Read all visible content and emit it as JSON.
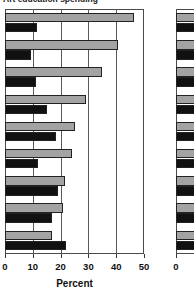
{
  "figure": {
    "title_partial": "Art education spending",
    "title_visible": "cropped"
  },
  "axis": {
    "label": "Percent",
    "ticks": [
      0,
      10,
      20,
      30,
      40,
      50
    ],
    "tick_labels": [
      "0",
      "10",
      "20",
      "30",
      "40",
      "50"
    ],
    "min": 0,
    "max": 50
  },
  "right_panel": {
    "tick_labels": [
      "0"
    ],
    "note": "clipped second panel"
  },
  "colors": {
    "series_gray": "#a3a3a3",
    "series_black": "#111111",
    "frame": "#4a4a4a",
    "gridline": "#5a5a5a",
    "background": "#ffffff"
  },
  "chart_data": {
    "type": "bar",
    "orientation": "horizontal",
    "title": "Art education spending",
    "xlabel": "Percent",
    "ylabel": "",
    "xlim": [
      0,
      50
    ],
    "xticks": [
      0,
      10,
      20,
      30,
      40,
      50
    ],
    "grid": true,
    "legend_position": "none",
    "categories": [
      "1",
      "2",
      "3",
      "4",
      "5",
      "6",
      "7",
      "8",
      "9"
    ],
    "series": [
      {
        "name": "Gray",
        "color": "#a3a3a3",
        "values": [
          46.5,
          40.5,
          35.0,
          29.0,
          25.0,
          24.0,
          21.5,
          21.0,
          17.0
        ]
      },
      {
        "name": "Black",
        "color": "#111111",
        "values": [
          11.5,
          9.5,
          11.0,
          15.0,
          18.5,
          12.0,
          19.0,
          17.0,
          22.0
        ]
      }
    ]
  }
}
